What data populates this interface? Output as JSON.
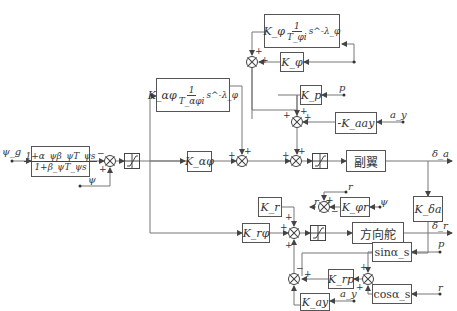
{
  "diagram": {
    "inputs": {
      "psi_cmd": "ψ_g",
      "psi": "ψ",
      "p_top": "p",
      "ay_top": "a_y",
      "r_mid": "r",
      "psi_mid": "ψ",
      "p_bot": "p",
      "r_bot": "r",
      "ay_bot": "a_y"
    },
    "outputs": {
      "delta_a": "δ_a",
      "delta_r": "δ_r"
    },
    "blocks": {
      "lead_filter_num": "1+α_ψβ_ψT_ψs",
      "lead_filter_den": "1+β_ψT_ψs",
      "k_phi_int_pre": "K_φ",
      "k_phi_int_num": "1",
      "k_phi_int_den": "T_φi",
      "k_phi_int_post": "s^-λ_φ",
      "k_phi": "K_φ",
      "k_p": "K_p",
      "k_aay": "-K_aay",
      "k_alpha_int_pre": "K_αφ",
      "k_alpha_int_num": "1",
      "k_alpha_int_den": "T_αφi",
      "k_alpha_int_post": "s^-λ_φ",
      "k_alpha": "K_αφ",
      "aileron": "副翼",
      "k_delta_a": "K_δa",
      "k_r": "K_r",
      "k_phi_r": "K_φr",
      "r_g": "r_g",
      "k_rphi": "K_rφ",
      "rudder": "方向舵",
      "k_rp": "K_rp",
      "sin_alpha": "sinα_s",
      "cos_alpha": "cosα_s",
      "k_ay": "K_ay"
    },
    "signs": {
      "plus": "+",
      "minus": "−"
    }
  }
}
